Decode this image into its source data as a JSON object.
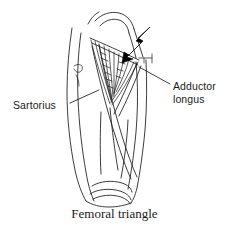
{
  "figure": {
    "title": "Femoral triangle",
    "caption": "Femoral triangle",
    "style": "line-drawing",
    "background_color": "#ffffff",
    "line_color": "#1a1a1a",
    "arrow_color": "#000000"
  },
  "labels": {
    "sartorius": "Sartorius",
    "adductor_longus_line1": "Adductor",
    "adductor_longus_line2": "longus"
  },
  "annotations": {
    "arrow": {
      "name": "pointer-arrow",
      "direction": "down-left",
      "points_to": "femoral-triangle"
    },
    "leader_lines": [
      {
        "name": "sartorius-leader",
        "from_label": "Sartorius",
        "to_structure": "sartorius-muscle-border"
      },
      {
        "name": "adductor-longus-leader",
        "from_label": "Adductor longus",
        "to_structure": "adductor-longus-muscle-border"
      }
    ]
  },
  "structures": [
    {
      "name": "thigh-outline",
      "label": ""
    },
    {
      "name": "femoral-triangle-region",
      "label": ""
    },
    {
      "name": "inguinal-ligament",
      "label": ""
    },
    {
      "name": "sartorius-muscle",
      "label": "Sartorius"
    },
    {
      "name": "adductor-longus-muscle",
      "label": "Adductor longus"
    },
    {
      "name": "femoral-vessels",
      "label": ""
    },
    {
      "name": "knee-patella",
      "label": ""
    }
  ]
}
